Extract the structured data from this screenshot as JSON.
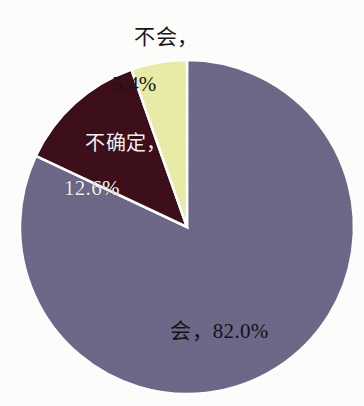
{
  "chart_data": {
    "type": "pie",
    "title": "",
    "subtitle": "",
    "xlabel": "",
    "ylabel": "",
    "legend_position": "none",
    "grid": false,
    "labels_shown_as": "category, percent",
    "categories": [
      "会",
      "不确定",
      "不会"
    ],
    "values": [
      82.0,
      12.6,
      5.4
    ],
    "units": "%",
    "start_angle_deg": 0,
    "direction": "clockwise",
    "slices": [
      {
        "name": "yes",
        "category": "会",
        "value": 82.0,
        "value_text": "82.0%",
        "label_text": "会，82.0%",
        "color": "#6e6888",
        "label_color": "#141318",
        "label_placement": "inside"
      },
      {
        "name": "unsure",
        "category": "不确定",
        "value": 12.6,
        "value_text": "12.6%",
        "label_line1": "不确定，",
        "label_line2": "12.6%",
        "label_text": "不确定，12.6%",
        "color": "#3d0f1a",
        "label_color": "#f4f1ee",
        "label_placement": "inside"
      },
      {
        "name": "no",
        "category": "不会",
        "value": 5.4,
        "value_text": "5.4%",
        "label_line1": "不会，",
        "label_line2": "5.4%",
        "label_text": "不会，5.4%",
        "color": "#e9eca6",
        "label_color": "#17161a",
        "label_placement": "outside-top"
      }
    ],
    "background_color": "#fdfdfc",
    "slice_separator_color": "#ffffff"
  },
  "geometry": {
    "center_x": 187,
    "center_y": 227,
    "radius": 167
  }
}
